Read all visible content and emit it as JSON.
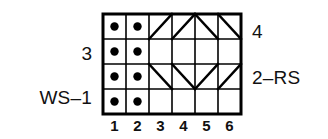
{
  "chart_data": {
    "type": "table",
    "title": "",
    "xlabel": "",
    "ylabel": "",
    "columns": [
      "1",
      "2",
      "3",
      "4",
      "5",
      "6"
    ],
    "rows": [
      "1",
      "2",
      "3",
      "4"
    ],
    "grid": {
      "cols": 6,
      "rows": 4,
      "cell_width": 23,
      "cell_height": 25,
      "origin_x": 103,
      "origin_y": 14,
      "line_color": "#000000",
      "border_width": 3,
      "inner_width": 1.6,
      "diagonal_width": 2.4,
      "fill_color": "#ffffff"
    },
    "cells": [
      {
        "row": 1,
        "col": 1,
        "symbol": "dot"
      },
      {
        "row": 1,
        "col": 2,
        "symbol": "dot"
      },
      {
        "row": 1,
        "col": 3,
        "symbol": "diagonal-up"
      },
      {
        "row": 1,
        "col": 4,
        "symbol": "diagonal-up"
      },
      {
        "row": 1,
        "col": 5,
        "symbol": "diagonal-down"
      },
      {
        "row": 1,
        "col": 6,
        "symbol": "diagonal-down"
      },
      {
        "row": 2,
        "col": 1,
        "symbol": "dot"
      },
      {
        "row": 2,
        "col": 2,
        "symbol": "dot"
      },
      {
        "row": 2,
        "col": 3,
        "symbol": "blank"
      },
      {
        "row": 2,
        "col": 4,
        "symbol": "blank"
      },
      {
        "row": 2,
        "col": 5,
        "symbol": "blank"
      },
      {
        "row": 2,
        "col": 6,
        "symbol": "blank"
      },
      {
        "row": 3,
        "col": 1,
        "symbol": "dot"
      },
      {
        "row": 3,
        "col": 2,
        "symbol": "dot"
      },
      {
        "row": 3,
        "col": 3,
        "symbol": "diagonal-down"
      },
      {
        "row": 3,
        "col": 4,
        "symbol": "diagonal-down"
      },
      {
        "row": 3,
        "col": 5,
        "symbol": "diagonal-up"
      },
      {
        "row": 3,
        "col": 6,
        "symbol": "diagonal-up"
      },
      {
        "row": 4,
        "col": 1,
        "symbol": "dot"
      },
      {
        "row": 4,
        "col": 2,
        "symbol": "dot"
      },
      {
        "row": 4,
        "col": 3,
        "symbol": "blank"
      },
      {
        "row": 4,
        "col": 4,
        "symbol": "blank"
      },
      {
        "row": 4,
        "col": 5,
        "symbol": "blank"
      },
      {
        "row": 4,
        "col": 6,
        "symbol": "blank"
      }
    ],
    "dot_radius": 4.2,
    "dot_color": "#000000"
  },
  "column_labels": [
    "1",
    "2",
    "3",
    "4",
    "5",
    "6"
  ],
  "row_labels": {
    "left": [
      {
        "text": "3",
        "row": 2
      },
      {
        "text": "WS–1",
        "row": 4
      }
    ],
    "right": [
      {
        "text": "4",
        "row": 1
      },
      {
        "text": "2–RS",
        "row": 3
      }
    ]
  },
  "labels": {
    "left_row3": "3",
    "left_ws1": "WS–1",
    "right_row4": "4",
    "right_2rs": "2–RS"
  }
}
